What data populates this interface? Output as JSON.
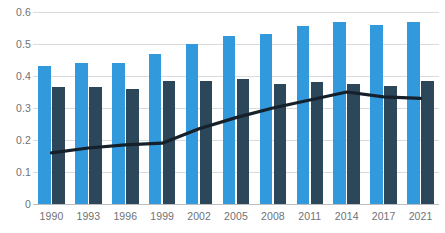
{
  "chart_data": {
    "type": "bar",
    "title": "",
    "subtitle": "",
    "xlabel": "",
    "ylabel": "",
    "ylim": [
      0,
      0.6
    ],
    "yticks": [
      0,
      0.1,
      0.2,
      0.3,
      0.4,
      0.5,
      0.6
    ],
    "ytick_labels": [
      "0",
      "0.1",
      "0.2",
      "0.3",
      "0.4",
      "0.5",
      "0.6"
    ],
    "grid": true,
    "legend": "none",
    "categories": [
      "1990",
      "1993",
      "1996",
      "1999",
      "2002",
      "2005",
      "2008",
      "2011",
      "2014",
      "2017",
      "2021"
    ],
    "series": [
      {
        "name": "series-1",
        "type": "bar",
        "color": "#3399DD",
        "values": [
          0.43,
          0.44,
          0.44,
          0.47,
          0.5,
          0.525,
          0.53,
          0.555,
          0.57,
          0.56,
          0.57
        ]
      },
      {
        "name": "series-2",
        "type": "bar",
        "color": "#2B4759",
        "values": [
          0.365,
          0.365,
          0.36,
          0.385,
          0.385,
          0.39,
          0.375,
          0.38,
          0.375,
          0.37,
          0.385
        ]
      },
      {
        "name": "series-3",
        "type": "line",
        "color": "#15202B",
        "values": [
          0.16,
          0.175,
          0.185,
          0.19,
          0.235,
          0.27,
          0.3,
          0.325,
          0.35,
          0.335,
          0.33
        ]
      }
    ]
  },
  "axis": {
    "y_tick_0": "0",
    "y_tick_1": "0.1",
    "y_tick_2": "0.2",
    "y_tick_3": "0.3",
    "y_tick_4": "0.4",
    "y_tick_5": "0.5",
    "y_tick_6": "0.6"
  }
}
